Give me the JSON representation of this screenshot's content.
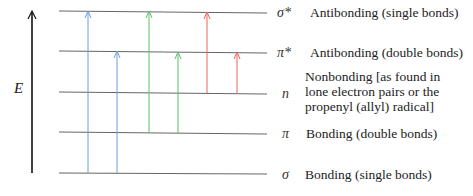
{
  "axis": {
    "label": "E",
    "meaning": "energy"
  },
  "levels": [
    {
      "id": "sigma-star",
      "symbol": "σ*",
      "description": "Antibonding (single bonds)"
    },
    {
      "id": "pi-star",
      "symbol": "π*",
      "description": "Antibonding (double bonds)"
    },
    {
      "id": "n",
      "symbol": "n",
      "description_lines": [
        "Nonbonding [as found in",
        "lone electron pairs or the",
        "propenyl (allyl) radical]"
      ]
    },
    {
      "id": "pi",
      "symbol": "π",
      "description": "Bonding (double bonds)"
    },
    {
      "id": "sigma",
      "symbol": "σ",
      "description": "Bonding (single bonds)"
    }
  ],
  "transitions": [
    {
      "from": "σ",
      "to": "σ*",
      "color": "#6a9fd8"
    },
    {
      "from": "σ",
      "to": "π*",
      "color": "#6a9fd8"
    },
    {
      "from": "π",
      "to": "σ*",
      "color": "#5cbf6a"
    },
    {
      "from": "π",
      "to": "π*",
      "color": "#5cbf6a"
    },
    {
      "from": "n",
      "to": "σ*",
      "color": "#e8675a"
    },
    {
      "from": "n",
      "to": "π*",
      "color": "#e8675a"
    }
  ]
}
